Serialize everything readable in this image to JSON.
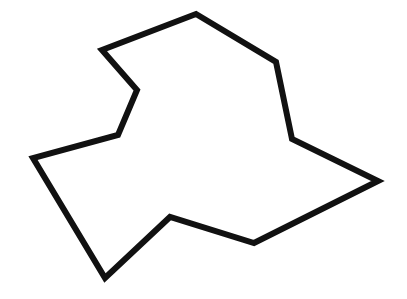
{
  "figure": {
    "background_color": "#ffffff",
    "stroke_color": "#111111",
    "outline_stroke_width": 6,
    "interior_stroke_width": 1.4,
    "canvas": {
      "width": 407,
      "height": 299
    },
    "vertex_count": 9,
    "interior_edge_count": 9
  },
  "chart_data": {
    "type": "diagram",
    "xlabel": "",
    "ylabel": "",
    "xlim": [
      0,
      407
    ],
    "ylim": [
      0,
      299
    ],
    "grid": false,
    "legend": "none",
    "vertices": [
      {
        "id": "v0",
        "name": "top-apex",
        "x": 196,
        "y": 14
      },
      {
        "id": "v1",
        "name": "hub-upper-right",
        "x": 276,
        "y": 62
      },
      {
        "id": "v2",
        "name": "right-tee",
        "x": 292,
        "y": 139
      },
      {
        "id": "v3",
        "name": "far-right-corner",
        "x": 378,
        "y": 181
      },
      {
        "id": "v4",
        "name": "bottom-right-notch",
        "x": 254,
        "y": 243
      },
      {
        "id": "v5",
        "name": "hub-lower-center",
        "x": 170,
        "y": 217
      },
      {
        "id": "v6",
        "name": "bottom-left-apex",
        "x": 105,
        "y": 278
      },
      {
        "id": "v7",
        "name": "left-corner",
        "x": 33,
        "y": 158
      },
      {
        "id": "v8",
        "name": "mid-left-junction",
        "x": 118,
        "y": 135
      },
      {
        "id": "v9",
        "name": "left-notch",
        "x": 137,
        "y": 90
      },
      {
        "id": "v10",
        "name": "top-left-corner",
        "x": 102,
        "y": 50
      }
    ],
    "outline_polygon": [
      [
        196,
        14
      ],
      [
        276,
        62
      ],
      [
        292,
        139
      ],
      [
        378,
        181
      ],
      [
        254,
        243
      ],
      [
        170,
        217
      ],
      [
        105,
        278
      ],
      [
        33,
        158
      ],
      [
        118,
        135
      ],
      [
        137,
        90
      ],
      [
        102,
        50
      ]
    ],
    "interior_edges": [
      {
        "from": "top-apex",
        "to": "left-notch",
        "points": [
          [
            196,
            14
          ],
          [
            137,
            90
          ]
        ]
      },
      {
        "from": "hub-upper-right",
        "to": "left-notch",
        "points": [
          [
            276,
            62
          ],
          [
            137,
            90
          ]
        ]
      },
      {
        "from": "hub-upper-right",
        "to": "mid-left-junction",
        "points": [
          [
            276,
            62
          ],
          [
            118,
            135
          ]
        ]
      },
      {
        "from": "hub-upper-right",
        "to": "hub-lower-center",
        "points": [
          [
            276,
            62
          ],
          [
            170,
            217
          ]
        ]
      },
      {
        "from": "hub-upper-right",
        "to": "right-tee",
        "points": [
          [
            276,
            62
          ],
          [
            292,
            139
          ]
        ]
      },
      {
        "from": "right-tee",
        "to": "hub-lower-center",
        "points": [
          [
            292,
            139
          ],
          [
            170,
            217
          ]
        ]
      },
      {
        "from": "right-tee",
        "to": "bottom-right-notch",
        "points": [
          [
            292,
            139
          ],
          [
            254,
            243
          ]
        ]
      },
      {
        "from": "mid-left-junction",
        "to": "hub-lower-center",
        "points": [
          [
            118,
            135
          ],
          [
            170,
            217
          ]
        ]
      },
      {
        "from": "mid-left-junction",
        "to": "bottom-left-apex",
        "points": [
          [
            118,
            135
          ],
          [
            105,
            278
          ]
        ]
      }
    ]
  }
}
